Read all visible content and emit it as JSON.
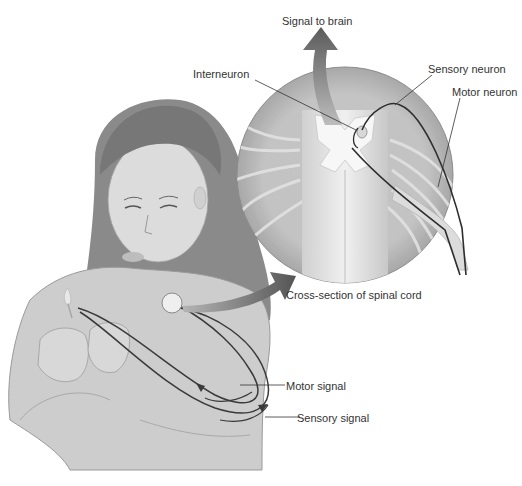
{
  "figure": {
    "labels": {
      "signal_to_brain": "Signal to brain",
      "interneuron": "Interneuron",
      "sensory_neuron": "Sensory neuron",
      "motor_neuron": "Motor neuron",
      "cross_section": "Cross-section of spinal cord",
      "motor_signal": "Motor signal",
      "sensory_signal": "Sensory signal"
    },
    "colors": {
      "arrow": "#5f5f5f",
      "disc": "#bdbdbd",
      "nerve": "#333333",
      "skin": "#d6d6d6",
      "hair": "#7a7a7a",
      "sweater": "#c9c9c9",
      "text": "#333333"
    }
  }
}
